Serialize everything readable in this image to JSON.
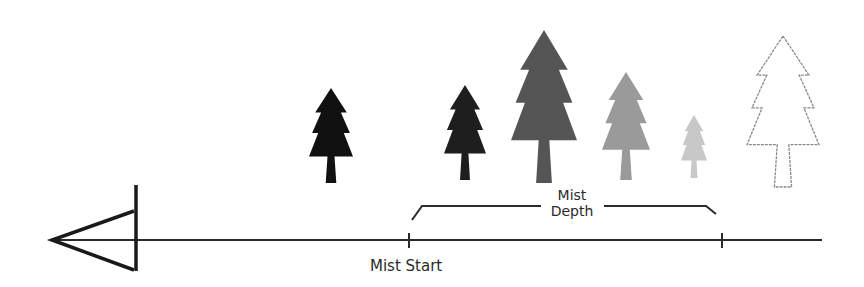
{
  "diagram": {
    "labels": {
      "mist_start": "Mist Start",
      "mist_depth_line1": "Mist",
      "mist_depth_line2": "Depth"
    },
    "camera": {
      "icon": "camera-frustum-icon",
      "apex": [
        52,
        240
      ],
      "plane_x": 136
    },
    "axis": {
      "y": 240,
      "x_start": 52,
      "x_end": 822,
      "color": "#2a2a2a"
    },
    "ticks": [
      {
        "name": "mist-start-tick",
        "x": 409
      },
      {
        "name": "mist-end-tick",
        "x": 722
      }
    ],
    "bracket": {
      "x_start": 412,
      "x_end": 716,
      "y": 206
    },
    "trees": [
      {
        "name": "tree-1",
        "cx": 331,
        "top": 88,
        "bottom": 183,
        "half_width": 22,
        "fill": "#111111",
        "style": "solid"
      },
      {
        "name": "tree-2",
        "cx": 465,
        "top": 85,
        "bottom": 180,
        "half_width": 21,
        "fill": "#1e1e1e",
        "style": "solid"
      },
      {
        "name": "tree-3",
        "cx": 544,
        "top": 30,
        "bottom": 183,
        "half_width": 33,
        "fill": "#555555",
        "style": "solid"
      },
      {
        "name": "tree-4",
        "cx": 626,
        "top": 72,
        "bottom": 180,
        "half_width": 24,
        "fill": "#9a9a9a",
        "style": "solid"
      },
      {
        "name": "tree-5",
        "cx": 694,
        "top": 115,
        "bottom": 178,
        "half_width": 13,
        "fill": "#c8c8c8",
        "style": "solid"
      },
      {
        "name": "tree-6",
        "cx": 783,
        "top": 36,
        "bottom": 187,
        "half_width": 36,
        "fill": "none",
        "stroke": "#8a8a8a",
        "style": "outline"
      }
    ]
  }
}
